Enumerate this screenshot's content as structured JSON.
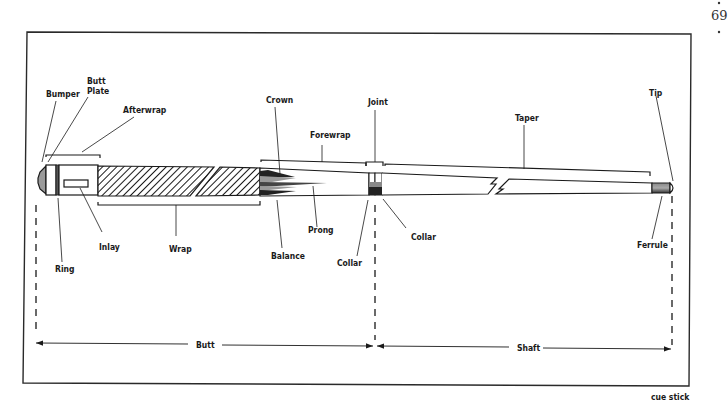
{
  "page": {
    "page_number": "69",
    "caption": "cue stick"
  },
  "diagram": {
    "title": "cue stick",
    "colors": {
      "ink": "#1a1a1a",
      "frame": "#2a2a2a",
      "paper": "#ffffff",
      "grey_fill": "#9a9a9a"
    },
    "labels": {
      "bumper": "Bumper",
      "butt_plate_line1": "Butt",
      "butt_plate_line2": "Plate",
      "afterwrap": "Afterwrap",
      "ring": "Ring",
      "inlay": "Inlay",
      "wrap": "Wrap",
      "crown": "Crown",
      "forewrap": "Forewrap",
      "balance": "Balance",
      "prong": "Prong",
      "joint": "Joint",
      "collar_left": "Collar",
      "collar_right": "Collar",
      "taper": "Taper",
      "tip": "Tip",
      "ferrule": "Ferrule"
    },
    "dimensions": {
      "butt": "Butt",
      "shaft": "Shaft"
    }
  }
}
